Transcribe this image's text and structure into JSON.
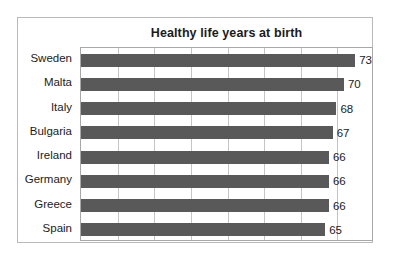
{
  "chart_data": {
    "type": "bar",
    "orientation": "horizontal",
    "title": "Healthy life years at birth",
    "xlabel": "",
    "ylabel": "",
    "categories": [
      "Sweden",
      "Malta",
      "Italy",
      "Bulgaria",
      "Ireland",
      "Germany",
      "Greece",
      "Spain"
    ],
    "values": [
      73,
      70,
      68,
      67,
      66,
      66,
      66,
      65
    ],
    "value_labels": [
      "73",
      "70",
      "68",
      "67",
      "66",
      "66",
      "66",
      "65"
    ],
    "xlim": [
      0,
      78
    ],
    "grid": true,
    "gridlines_count": 8,
    "legend": null,
    "bar_color": "#595959",
    "plot_border_color": "#a8a8a8",
    "frame_border_color": "#b9b9b9",
    "background_color": "#ffffff",
    "text_color": "#1b1b1b"
  }
}
